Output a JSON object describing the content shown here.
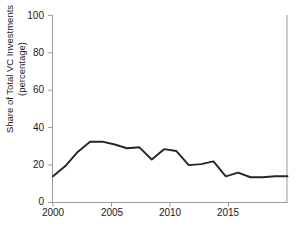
{
  "chart_data": {
    "type": "line",
    "title": "",
    "xlabel": "",
    "ylabel": "Share of Total VC Investments (percentage)",
    "ylabel_line1": "Share of Total VC Investments",
    "ylabel_line2": "(percentage)",
    "xlim": [
      2000,
      2019
    ],
    "ylim": [
      0,
      100
    ],
    "grid": false,
    "legend": "none",
    "line_color": "#262626",
    "background_color": "#ffffff",
    "axis_color": "#9a9a9a",
    "yticks": [
      0,
      20,
      40,
      60,
      80,
      100
    ],
    "ytick_labels": [
      "0",
      "20",
      "40",
      "60",
      "80",
      "100"
    ],
    "xticks": [
      2000,
      2005,
      2010,
      2015
    ],
    "xtick_labels": [
      "2000",
      "2005",
      "2010",
      "2015"
    ],
    "x": [
      2000,
      2001,
      2002,
      2003,
      2004,
      2005,
      2006,
      2007,
      2008,
      2009,
      2010,
      2011,
      2012,
      2013,
      2014,
      2015,
      2016,
      2017,
      2018,
      2019
    ],
    "values": [
      14,
      19.5,
      27,
      32.5,
      32.5,
      31,
      29,
      29.5,
      23,
      28.5,
      27.5,
      20,
      20.5,
      22,
      14,
      16,
      13.5,
      13.5,
      14,
      14
    ],
    "series": [
      {
        "name": "Share of Total VC Investments",
        "values": [
          14,
          19.5,
          27,
          32.5,
          32.5,
          31,
          29,
          29.5,
          23,
          28.5,
          27.5,
          20,
          20.5,
          22,
          14,
          16,
          13.5,
          13.5,
          14,
          14
        ]
      }
    ]
  },
  "figure": {
    "cropped_title_fragment": "·"
  }
}
